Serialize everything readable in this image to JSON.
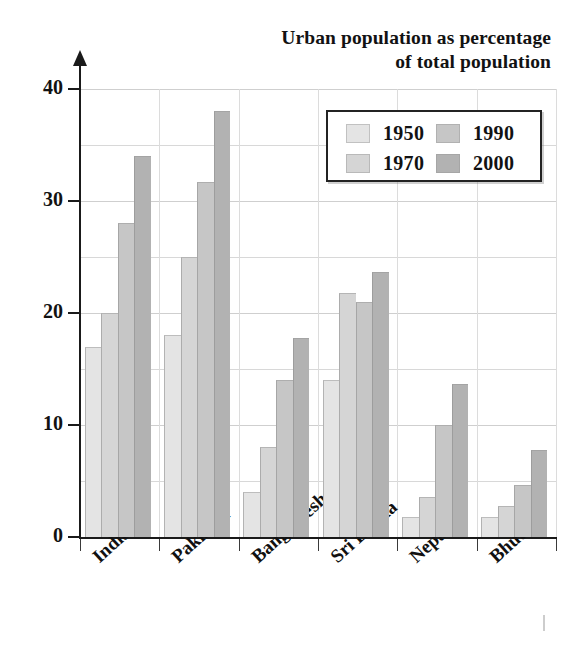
{
  "chart_data": {
    "type": "bar",
    "title": "Urban population as percentage of total population",
    "title_lines": [
      "Urban population as percentage",
      "of total population"
    ],
    "xlabel": "",
    "ylabel": "",
    "ylim": [
      0,
      40
    ],
    "yticks": [
      0,
      10,
      20,
      30,
      40
    ],
    "ytick_labels": [
      "0",
      "10",
      "20",
      "30",
      "40"
    ],
    "gridlines_minor": [
      5,
      15,
      25,
      35
    ],
    "grid": true,
    "legend_position": "top-right",
    "categories": [
      "India",
      "Pakistan",
      "Bangladesh",
      "Sri Lanka",
      "Nepal",
      "Bhutan"
    ],
    "series": [
      {
        "name": "1950",
        "color": "#e4e4e4",
        "values": [
          17,
          18,
          4,
          14,
          1.8,
          1.8
        ]
      },
      {
        "name": "1970",
        "color": "#d5d5d5",
        "values": [
          20,
          25,
          8,
          21.8,
          3.6,
          2.8
        ]
      },
      {
        "name": "1990",
        "color": "#c6c6c6",
        "values": [
          28,
          31.7,
          14,
          21,
          10,
          4.6
        ]
      },
      {
        "name": "2000",
        "color": "#b2b2b2",
        "values": [
          34,
          38,
          17.8,
          23.7,
          13.7,
          7.8
        ]
      }
    ]
  },
  "axis": {
    "y_axis_name": "y-axis-line",
    "x_axis_name": "x-axis-line",
    "arrow_icon": "up-arrow-icon"
  },
  "legend": {
    "entries": [
      {
        "label": "1950",
        "color": "#e4e4e4"
      },
      {
        "label": "1970",
        "color": "#d5d5d5"
      },
      {
        "label": "1990",
        "color": "#c6c6c6"
      },
      {
        "label": "2000",
        "color": "#b2b2b2"
      }
    ]
  },
  "colors": {
    "axis": "#1a1a1a",
    "grid": "#d8d8d8",
    "text": "#121212",
    "legend_border": "#232323",
    "background": "#ffffff"
  }
}
